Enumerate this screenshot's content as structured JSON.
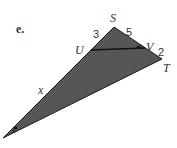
{
  "problem": {
    "part_label": "e."
  },
  "diagram": {
    "fill_color": "#555555",
    "line_color": "#1a1a1a",
    "vertices": {
      "S": "S",
      "T": "T",
      "U": "U",
      "V": "V"
    },
    "segments": {
      "SU": "3",
      "SV": "5",
      "VT": "2",
      "U_to_bottom": "x"
    },
    "angle_marks": [
      "angle-at-V",
      "angle-at-bottom-vertex"
    ]
  }
}
